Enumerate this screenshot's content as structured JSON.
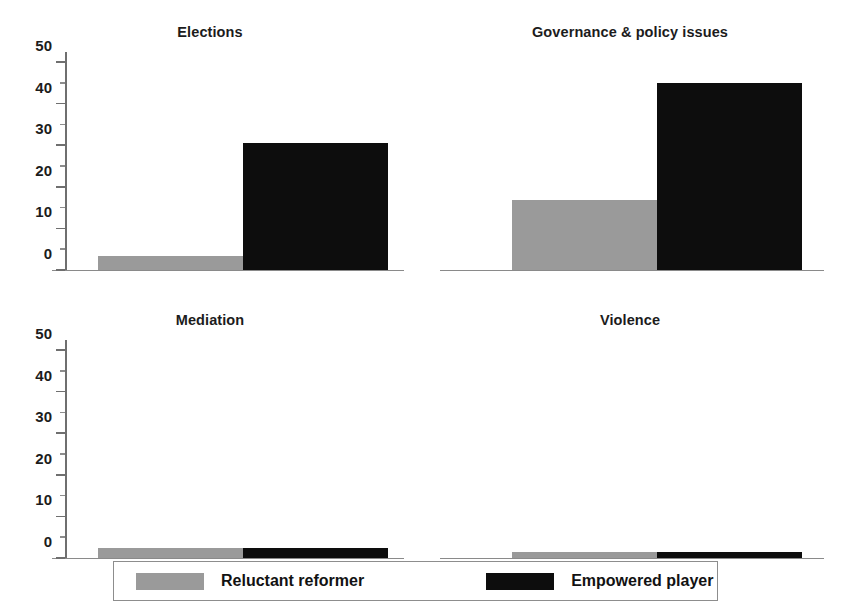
{
  "chart_data": {
    "type": "bar",
    "title": "",
    "subtitle": "",
    "xlabel": "",
    "ylabel": "",
    "ylim": [
      0,
      50
    ],
    "yticks": [
      0,
      10,
      20,
      30,
      40,
      50
    ],
    "ytick_labels": [
      "0",
      "10",
      "20",
      "30",
      "40",
      "50"
    ],
    "yminor_ticks": [
      5,
      15,
      25,
      35,
      45
    ],
    "grid": false,
    "legend_position": "bottom",
    "series": [
      {
        "name": "Reluctant reformer",
        "color": "#9a9a9a",
        "values": [
          3.4,
          16.8,
          2.4,
          1.5
        ]
      },
      {
        "name": "Empowered player",
        "color": "#0d0d0d",
        "values": [
          30.5,
          45.0,
          2.4,
          1.5
        ]
      }
    ],
    "panels": [
      {
        "title": "Elections",
        "categories": [
          "Reluctant reformer",
          "Empowered player"
        ],
        "values": [
          3.4,
          30.5
        ]
      },
      {
        "title": "Governance & policy issues",
        "categories": [
          "Reluctant reformer",
          "Empowered player"
        ],
        "values": [
          16.8,
          45.0
        ]
      },
      {
        "title": "Mediation",
        "categories": [
          "Reluctant reformer",
          "Empowered player"
        ],
        "values": [
          2.4,
          2.4
        ]
      },
      {
        "title": "Violence",
        "categories": [
          "Reluctant reformer",
          "Empowered player"
        ],
        "values": [
          1.5,
          1.5
        ]
      }
    ]
  },
  "legend": {
    "entries": [
      {
        "label": "Reluctant reformer",
        "color": "#9a9a9a"
      },
      {
        "label": "Empowered player",
        "color": "#0d0d0d"
      }
    ]
  },
  "axis": {
    "tick_labels": [
      "50",
      "40",
      "30",
      "20",
      "10",
      "0"
    ]
  },
  "panels": [
    {
      "title": "Elections"
    },
    {
      "title": "Governance & policy issues"
    },
    {
      "title": "Mediation"
    },
    {
      "title": "Violence"
    }
  ]
}
